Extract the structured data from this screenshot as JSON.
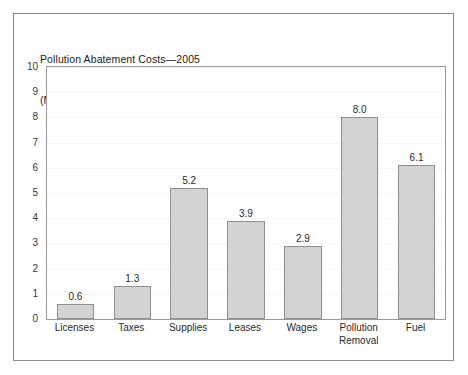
{
  "figure": {
    "title_line_1": "Pollution Abatement Costs—2005",
    "title_line_2": "(Millions of dollars)",
    "border_color": "#8c8c8c",
    "background_color": "#ffffff"
  },
  "chart_data": {
    "type": "bar",
    "title": "Pollution Abatement Costs—2005 (Millions of dollars)",
    "xlabel": "",
    "ylabel": "",
    "ylim": [
      0,
      10
    ],
    "yticks": [
      0,
      1,
      2,
      3,
      4,
      5,
      6,
      7,
      8,
      9,
      10
    ],
    "ytick_labels": [
      "0",
      "1",
      "2",
      "3",
      "4",
      "5",
      "6",
      "7",
      "8",
      "9",
      "10"
    ],
    "grid": true,
    "legend": false,
    "categories": [
      "Licenses",
      "Taxes",
      "Supplies",
      "Leases",
      "Wages",
      "Pollution\nRemoval",
      "Fuel"
    ],
    "values": [
      0.6,
      1.3,
      5.2,
      3.9,
      2.9,
      8.0,
      6.1
    ],
    "value_labels": [
      "0.6",
      "1.3",
      "5.2",
      "3.9",
      "2.9",
      "8.0",
      "6.1"
    ],
    "bar_fill_color": "#d3d3d3",
    "bar_edge_color": "#8f8f8f",
    "gridline_color": "#ededed",
    "axis_color": "#9a9a9a"
  }
}
